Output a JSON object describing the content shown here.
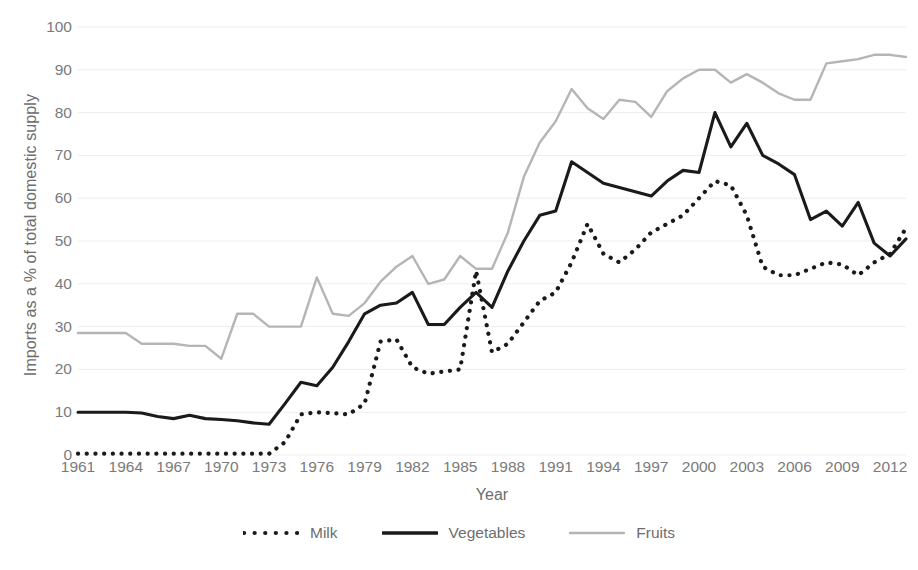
{
  "chart_data": {
    "type": "line",
    "title": "",
    "xlabel": "Year",
    "ylabel": "Imports as a % of total domestic supply",
    "xlim": [
      1961,
      2013
    ],
    "ylim": [
      0,
      100
    ],
    "ytick_labels": [
      "0",
      "10",
      "20",
      "30",
      "40",
      "50",
      "60",
      "70",
      "80",
      "90",
      "100"
    ],
    "ytick_values": [
      0,
      10,
      20,
      30,
      40,
      50,
      60,
      70,
      80,
      90,
      100
    ],
    "xtick_labels": [
      "1961",
      "1964",
      "1967",
      "1970",
      "1973",
      "1976",
      "1979",
      "1982",
      "1985",
      "1988",
      "1991",
      "1994",
      "1997",
      "2000",
      "2003",
      "2006",
      "2009",
      "2012"
    ],
    "xtick_values": [
      1961,
      1964,
      1967,
      1970,
      1973,
      1976,
      1979,
      1982,
      1985,
      1988,
      1991,
      1994,
      1997,
      2000,
      2003,
      2006,
      2009,
      2012
    ],
    "grid": true,
    "grid_axis": "y",
    "legend_position": "bottom",
    "x": [
      1961,
      1962,
      1963,
      1964,
      1965,
      1966,
      1967,
      1968,
      1969,
      1970,
      1971,
      1972,
      1973,
      1974,
      1975,
      1976,
      1977,
      1978,
      1979,
      1980,
      1981,
      1982,
      1983,
      1984,
      1985,
      1986,
      1987,
      1988,
      1989,
      1990,
      1991,
      1992,
      1993,
      1994,
      1995,
      1996,
      1997,
      1998,
      1999,
      2000,
      2001,
      2002,
      2003,
      2004,
      2005,
      2006,
      2007,
      2008,
      2009,
      2010,
      2011,
      2012,
      2013
    ],
    "series": [
      {
        "name": "Milk",
        "style": "dotted",
        "color": "#1a1a1a",
        "values": [
          0.3,
          0.3,
          0.3,
          0.3,
          0.3,
          0.3,
          0.3,
          0.3,
          0.3,
          0.3,
          0.3,
          0.3,
          0.3,
          3.0,
          9.5,
          10.0,
          9.8,
          9.5,
          12.0,
          26.5,
          27.0,
          20.5,
          19.0,
          19.5,
          20.0,
          43.0,
          24.0,
          26.0,
          31.0,
          36.0,
          38.0,
          45.0,
          54.0,
          47.0,
          45.0,
          48.0,
          52.0,
          54.0,
          56.0,
          60.0,
          64.0,
          63.0,
          56.0,
          44.0,
          42.0,
          42.0,
          43.5,
          45.0,
          44.5,
          42.0,
          45.0,
          47.0,
          53.0
        ]
      },
      {
        "name": "Vegetables",
        "style": "solid",
        "color": "#1a1a1a",
        "values": [
          10.0,
          10.0,
          10.0,
          10.0,
          9.8,
          9.0,
          8.5,
          9.3,
          8.5,
          8.3,
          8.0,
          7.5,
          7.2,
          12.0,
          17.0,
          16.2,
          20.5,
          26.5,
          33.0,
          35.0,
          35.5,
          38.0,
          30.5,
          30.5,
          34.5,
          38.0,
          34.5,
          43.0,
          50.0,
          56.0,
          57.0,
          68.5,
          66.0,
          63.5,
          62.5,
          61.5,
          60.5,
          64.0,
          66.5,
          66.0,
          80.0,
          72.0,
          77.5,
          70.0,
          68.0,
          65.5,
          55.0,
          57.0,
          53.5,
          59.0,
          49.5,
          46.5,
          50.5
        ]
      },
      {
        "name": "Fruits",
        "style": "solid",
        "color": "#b5b5b5",
        "values": [
          28.5,
          28.5,
          28.5,
          28.5,
          26.0,
          26.0,
          26.0,
          25.5,
          25.5,
          22.5,
          33.0,
          33.0,
          30.0,
          30.0,
          30.0,
          41.5,
          33.0,
          32.5,
          35.5,
          40.5,
          44.0,
          46.5,
          40.0,
          41.0,
          46.5,
          43.5,
          43.5,
          52.0,
          65.0,
          73.0,
          78.0,
          85.5,
          81.0,
          78.5,
          83.0,
          82.5,
          79.0,
          85.0,
          88.0,
          90.0,
          90.0,
          87.0,
          89.0,
          87.0,
          84.5,
          83.0,
          83.0,
          91.5,
          92.0,
          92.5,
          93.5,
          93.5,
          93.0
        ]
      }
    ]
  },
  "legend": {
    "items": [
      {
        "label": "Milk",
        "swatch": "dotted-line-swatch"
      },
      {
        "label": "Vegetables",
        "swatch": "solid-line-swatch"
      },
      {
        "label": "Fruits",
        "swatch": "light-solid-line-swatch"
      }
    ]
  },
  "axes": {
    "x_title": "Year",
    "y_title": "Imports as a % of total domestic supply"
  },
  "colors": {
    "milk": "#1a1a1a",
    "vegetables": "#1a1a1a",
    "fruits": "#b5b5b5",
    "grid": "#ededed",
    "tick_text": "#7a7a7a",
    "axis_title_text": "#6d6d6d",
    "background": "#ffffff"
  }
}
